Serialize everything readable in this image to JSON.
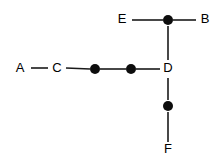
{
  "diagram": {
    "background_color": "#ffffff",
    "line_color": "#1a1a1a",
    "dot_color": "#0d0d0d",
    "label_color": "#000000",
    "width": 219,
    "height": 162,
    "labels": {
      "a": "A",
      "b": "B",
      "c": "C",
      "d": "D",
      "e": "E",
      "f": "F"
    },
    "nodes": [
      {
        "id": "A",
        "label": "A",
        "x": 20,
        "y": 69,
        "type": "labeled"
      },
      {
        "id": "C",
        "label": "C",
        "x": 57,
        "y": 69,
        "type": "labeled"
      },
      {
        "id": "m1",
        "label": "",
        "x": 95,
        "y": 69,
        "type": "dot"
      },
      {
        "id": "m2",
        "label": "",
        "x": 131,
        "y": 69,
        "type": "dot"
      },
      {
        "id": "D",
        "label": "D",
        "x": 168,
        "y": 69,
        "type": "labeled"
      },
      {
        "id": "E",
        "label": "E",
        "x": 122,
        "y": 20,
        "type": "labeled"
      },
      {
        "id": "t1",
        "label": "",
        "x": 168,
        "y": 20,
        "type": "dot"
      },
      {
        "id": "B",
        "label": "B",
        "x": 205,
        "y": 20,
        "type": "labeled"
      },
      {
        "id": "b1",
        "label": "",
        "x": 168,
        "y": 106,
        "type": "dot"
      },
      {
        "id": "F",
        "label": "F",
        "x": 168,
        "y": 150,
        "type": "labeled"
      }
    ],
    "edges": [
      {
        "from": "A",
        "to": "C",
        "x1": 31,
        "y1": 68,
        "x2": 48,
        "y2": 68
      },
      {
        "from": "C",
        "to": "m1",
        "x1": 66,
        "y1": 68,
        "x2": 90,
        "y2": 69
      },
      {
        "from": "m1",
        "to": "m2",
        "x1": 100,
        "y1": 69,
        "x2": 126,
        "y2": 69
      },
      {
        "from": "m2",
        "to": "D",
        "x1": 136,
        "y1": 69,
        "x2": 160,
        "y2": 69
      },
      {
        "from": "E",
        "to": "t1",
        "x1": 132,
        "y1": 20,
        "x2": 163,
        "y2": 20
      },
      {
        "from": "t1",
        "to": "B",
        "x1": 173,
        "y1": 20,
        "x2": 196,
        "y2": 20
      },
      {
        "from": "t1",
        "to": "D",
        "x1": 168,
        "y1": 26,
        "x2": 168,
        "y2": 60
      },
      {
        "from": "D",
        "to": "b1",
        "x1": 168,
        "y1": 78,
        "x2": 168,
        "y2": 100
      },
      {
        "from": "b1",
        "to": "F",
        "x1": 168,
        "y1": 112,
        "x2": 168,
        "y2": 142
      }
    ],
    "dot_radius": 5
  }
}
